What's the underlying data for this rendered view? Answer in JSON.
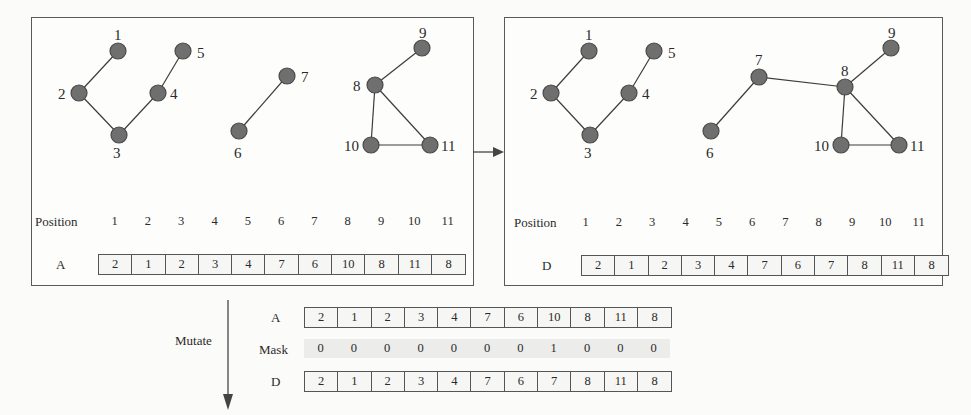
{
  "panel_before": {
    "position_label": "Position",
    "positions": [
      "1",
      "2",
      "3",
      "4",
      "5",
      "6",
      "7",
      "8",
      "9",
      "10",
      "11"
    ],
    "array_label": "A",
    "array": [
      "2",
      "1",
      "2",
      "3",
      "4",
      "7",
      "6",
      "10",
      "8",
      "11",
      "8"
    ],
    "node_labels": [
      "1",
      "2",
      "3",
      "4",
      "5",
      "6",
      "7",
      "8",
      "9",
      "10",
      "11"
    ]
  },
  "panel_after": {
    "position_label": "Position",
    "positions": [
      "1",
      "2",
      "3",
      "4",
      "5",
      "6",
      "7",
      "8",
      "9",
      "10",
      "11"
    ],
    "array_label": "D",
    "array": [
      "2",
      "1",
      "2",
      "3",
      "4",
      "7",
      "6",
      "7",
      "8",
      "11",
      "8"
    ],
    "node_labels": [
      "1",
      "2",
      "3",
      "4",
      "5",
      "6",
      "7",
      "8",
      "9",
      "10",
      "11"
    ]
  },
  "mutation": {
    "arrow_label": "Mutate",
    "rows": [
      {
        "label": "A",
        "values": [
          "2",
          "1",
          "2",
          "3",
          "4",
          "7",
          "6",
          "10",
          "8",
          "11",
          "8"
        ],
        "boxed": true
      },
      {
        "label": "Mask",
        "values": [
          "0",
          "0",
          "0",
          "0",
          "0",
          "0",
          "0",
          "1",
          "0",
          "0",
          "0"
        ],
        "boxed": false
      },
      {
        "label": "D",
        "values": [
          "2",
          "1",
          "2",
          "3",
          "4",
          "7",
          "6",
          "7",
          "8",
          "11",
          "8"
        ],
        "boxed": true
      }
    ]
  },
  "colors": {
    "node_fill": "#6f6f6f",
    "edge": "#3c3c3c",
    "border": "#5a5a5a",
    "mask_bg": "#ececea"
  }
}
